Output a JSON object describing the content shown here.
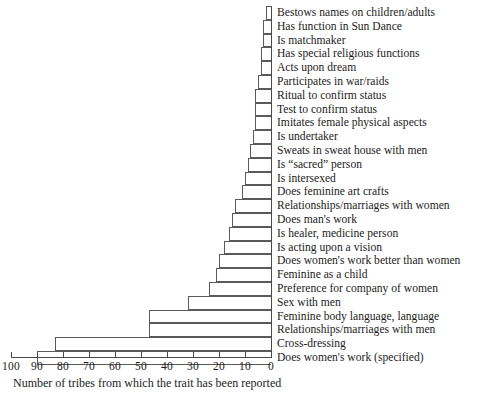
{
  "chart_data": {
    "type": "bar",
    "orientation": "horizontal",
    "title": "",
    "xlabel": "Number of tribes from which the trait has been reported",
    "ylabel": "",
    "xlim": [
      100,
      0
    ],
    "x_axis_reversed": true,
    "grid": false,
    "legend": null,
    "tick_labels": [
      "100",
      "90",
      "80",
      "70",
      "60",
      "50",
      "40",
      "30",
      "20",
      "10",
      "0"
    ],
    "tick_values": [
      100,
      90,
      80,
      70,
      60,
      50,
      40,
      30,
      20,
      10,
      0
    ],
    "categories": [
      "Bestows names on children/adults",
      "Has function in Sun Dance",
      "Is matchmaker",
      "Has special religious functions",
      "Acts upon dream",
      "Participates in war/raids",
      "Ritual to confirm status",
      "Test to confirm status",
      "Imitates female physical aspects",
      "Is undertaker",
      "Sweats in sweat house with men",
      "Is “sacred” person",
      "Is intersexed",
      "Does feminine art crafts",
      "Relationships/marriages with women",
      "Does man's work",
      "Is healer, medicine person",
      "Is acting upon a vision",
      "Does women's work better than women",
      "Feminine as a child",
      "Preference for company of women",
      "Sex with men",
      "Feminine body language, language",
      "Relationships/marriages with men",
      "Cross-dressing",
      "Does women's work (specified)"
    ],
    "values": [
      2,
      3,
      3,
      4,
      4,
      5,
      6,
      6,
      6,
      7,
      8,
      9,
      10,
      11,
      14,
      15,
      16,
      18,
      20,
      21,
      24,
      32,
      47,
      47,
      83,
      90
    ]
  }
}
